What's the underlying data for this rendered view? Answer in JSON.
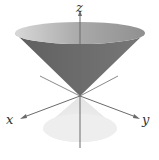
{
  "figure": {
    "axes": {
      "x": {
        "label": "x"
      },
      "y": {
        "label": "y"
      },
      "z": {
        "label": "z"
      }
    },
    "colors": {
      "upper_cone_outer": "#6e6e6e",
      "upper_cone_rim": "#a8a8a8",
      "lower_cone": "#ececec",
      "axis_line": "#6a6a6a",
      "label": "#333333",
      "background": "#ffffff"
    }
  }
}
